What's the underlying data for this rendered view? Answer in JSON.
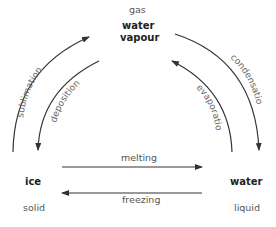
{
  "states": {
    "gas": {
      "phase": "gas",
      "name_line1": "water",
      "name_line2": "vapour"
    },
    "solid": {
      "phase": "solid",
      "name": "ice"
    },
    "liquid": {
      "phase": "liquid",
      "name": "water"
    }
  },
  "processes": {
    "sublimation": "sublimation",
    "deposition": "deposition",
    "condensation": "condensation",
    "evaporation": "evaporation",
    "melting": "melting",
    "freezing": "freezing"
  },
  "colors": {
    "arrow": "#333333",
    "text": "#555555"
  }
}
